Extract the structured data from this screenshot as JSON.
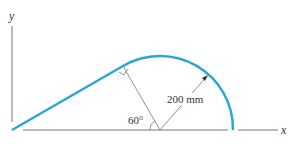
{
  "diagram": {
    "axis_y_label": "y",
    "axis_x_label": "x",
    "angle_label": "60°",
    "radius_label": "200 mm",
    "colors": {
      "path": "#2aa6d6",
      "lines": "#777777",
      "text": "#333333"
    }
  }
}
